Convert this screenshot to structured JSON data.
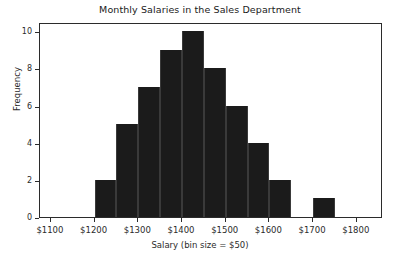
{
  "chart_data": {
    "type": "bar",
    "title": "Monthly Salaries in the Sales Department",
    "xlabel": "Salary (bin size = $50)",
    "ylabel": "Frequency",
    "grid": false,
    "legend": false,
    "xlim": [
      1075,
      1860
    ],
    "ylim": [
      0,
      10.5
    ],
    "bin_size": 50,
    "xticks": [
      1100,
      1200,
      1300,
      1400,
      1500,
      1600,
      1700,
      1800
    ],
    "xtick_labels": [
      "$1100",
      "$1200",
      "$1300",
      "$1400",
      "$1500",
      "$1600",
      "$1700",
      "$1800"
    ],
    "yticks": [
      0,
      2,
      4,
      6,
      8,
      10
    ],
    "ytick_labels": [
      "0",
      "2",
      "4",
      "6",
      "8",
      "10"
    ],
    "bar_color": "#1b1b1b",
    "bar_edge_color": "#3a3a3a",
    "bins": [
      {
        "start": 1200,
        "end": 1250,
        "value": 2
      },
      {
        "start": 1250,
        "end": 1300,
        "value": 5
      },
      {
        "start": 1300,
        "end": 1350,
        "value": 7
      },
      {
        "start": 1350,
        "end": 1400,
        "value": 9
      },
      {
        "start": 1400,
        "end": 1450,
        "value": 10
      },
      {
        "start": 1450,
        "end": 1500,
        "value": 8
      },
      {
        "start": 1500,
        "end": 1550,
        "value": 6
      },
      {
        "start": 1550,
        "end": 1600,
        "value": 4
      },
      {
        "start": 1600,
        "end": 1650,
        "value": 2
      },
      {
        "start": 1700,
        "end": 1750,
        "value": 1
      }
    ],
    "categories": [
      "1200-1250",
      "1250-1300",
      "1300-1350",
      "1350-1400",
      "1400-1450",
      "1450-1500",
      "1500-1550",
      "1550-1600",
      "1600-1650",
      "1700-1750"
    ],
    "values": [
      2,
      5,
      7,
      9,
      10,
      8,
      6,
      4,
      2,
      1
    ]
  }
}
